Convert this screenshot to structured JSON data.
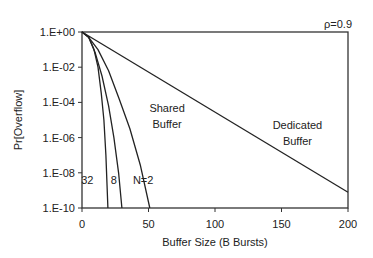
{
  "chart_data": {
    "type": "line",
    "title": "",
    "xlabel": "Buffer Size (B Bursts)",
    "ylabel": "Pr[Overflow]",
    "xlim": [
      0,
      200
    ],
    "ylim_log10": [
      -10,
      0
    ],
    "yscale": "log",
    "grid": false,
    "x_ticks": [
      0,
      50,
      100,
      150,
      200
    ],
    "x_tick_labels": [
      "0",
      "50",
      "100",
      "150",
      "200"
    ],
    "y_ticks_log10": [
      0,
      -2,
      -4,
      -6,
      -8,
      -10
    ],
    "y_tick_labels": [
      "1.E+00",
      "1.E-02",
      "1.E-04",
      "1.E-06",
      "1.E-08",
      "1.E-10"
    ],
    "series": [
      {
        "name": "Dedicated Buffer",
        "x": [
          0,
          200
        ],
        "log10_y": [
          0,
          -9.1
        ]
      },
      {
        "name": "Shared Buffer N=2",
        "x": [
          0,
          5,
          12,
          20,
          28,
          36,
          44,
          51
        ],
        "log10_y": [
          0,
          -0.3,
          -1,
          -2.2,
          -3.8,
          -5.5,
          -7.6,
          -10
        ]
      },
      {
        "name": "Shared Buffer N=8",
        "x": [
          0,
          5,
          10,
          15,
          20,
          24,
          27.5,
          30
        ],
        "log10_y": [
          0,
          -0.3,
          -1.2,
          -2.5,
          -4.2,
          -6,
          -8,
          -10
        ]
      },
      {
        "name": "Shared Buffer N=32",
        "x": [
          0,
          5,
          9,
          12,
          14.5,
          16.5,
          18,
          19.5
        ],
        "log10_y": [
          0,
          -0.3,
          -1,
          -2,
          -3.5,
          -5,
          -7,
          -10
        ]
      }
    ],
    "annotations": [
      {
        "text": "ρ=0.9",
        "x": 182,
        "log10_y": 0.45
      },
      {
        "text": "Shared",
        "x": 64,
        "log10_y": -4.3
      },
      {
        "text": "Buffer",
        "x": 64,
        "log10_y": -5.2
      },
      {
        "text": "Dedicated",
        "x": 162,
        "log10_y": -5.3
      },
      {
        "text": "Buffer",
        "x": 162,
        "log10_y": -6.2
      },
      {
        "text": "32",
        "x": 4,
        "log10_y": -8.4
      },
      {
        "text": "8",
        "x": 24,
        "log10_y": -8.4
      },
      {
        "text": "N=2",
        "x": 46,
        "log10_y": -8.4
      }
    ]
  }
}
